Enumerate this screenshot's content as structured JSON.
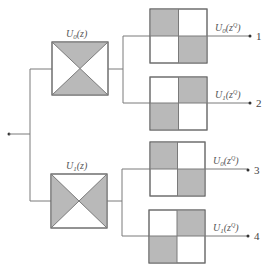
{
  "diagram": {
    "title": "",
    "input": {
      "label": ""
    },
    "stage1": [
      {
        "id": "U0",
        "label_base": "U",
        "label_sub": "0",
        "label_arg": "(z)",
        "pattern": "hourglass-top-bottom"
      },
      {
        "id": "U1",
        "label_base": "U",
        "label_sub": "1",
        "label_arg": "(z)",
        "pattern": "hourglass-left-right"
      }
    ],
    "stage2": [
      {
        "label_base": "U",
        "label_sub": "0",
        "label_arg": "(z",
        "label_sup": "Q",
        "label_close": ")",
        "output": "1",
        "pattern": "checker-tl-br"
      },
      {
        "label_base": "U",
        "label_sub": "1",
        "label_arg": "(z",
        "label_sup": "Q",
        "label_close": ")",
        "output": "2",
        "pattern": "checker-tr-bl"
      },
      {
        "label_base": "U",
        "label_sub": "0",
        "label_arg": "(z",
        "label_sup": "Q",
        "label_close": ")",
        "output": "3",
        "pattern": "checker-tl-br"
      },
      {
        "label_base": "U",
        "label_sub": "1",
        "label_arg": "(z",
        "label_sup": "Q",
        "label_close": ")",
        "output": "4",
        "pattern": "checker-tr-bl"
      }
    ],
    "colors": {
      "shade": "#b9b9b9",
      "line": "#7a7a7a"
    }
  }
}
